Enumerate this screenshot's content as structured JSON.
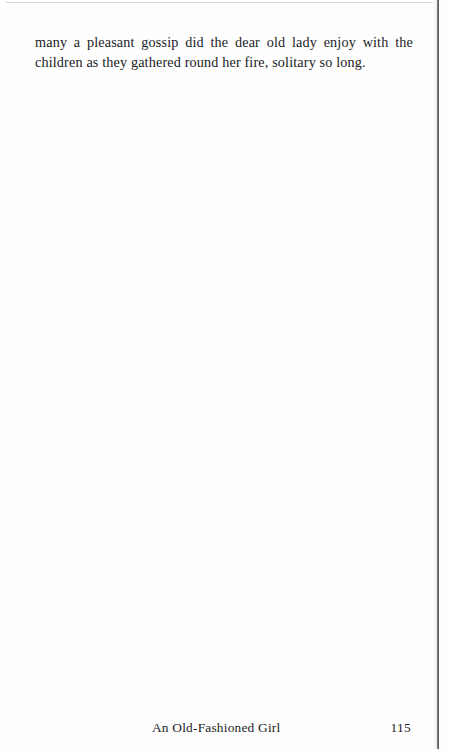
{
  "document": {
    "kind": "scanned-book-page",
    "paper_color": "#fefefe",
    "ink_color": "#1b1b1f"
  },
  "body": {
    "paragraph_lines": [
      {
        "justified": true,
        "words": [
          "many",
          "a",
          "pleasant",
          "gossip",
          "did",
          "the",
          "dear",
          "old",
          "lady",
          "enjoy",
          "with",
          "the"
        ]
      },
      {
        "justified": false,
        "text": "children as they gathered round her fire, solitary so long."
      }
    ],
    "full_text": "many a pleasant gossip did the dear old lady enjoy with the children as they gathered round her fire, solitary so long."
  },
  "footer": {
    "running_title": "An Old-Fashioned Girl",
    "page_number": "115"
  },
  "scan_artifacts": {
    "right_edge_line_color": "#4a4a4e",
    "top_edge_line_color": "#d8d8d8"
  }
}
